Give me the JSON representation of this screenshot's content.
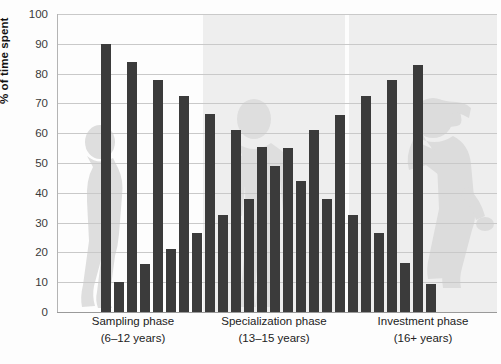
{
  "chart_data": {
    "type": "bar",
    "title": "",
    "xlabel": "",
    "ylabel": "% of time spent",
    "ylim": [
      0,
      100
    ],
    "yticks": [
      0,
      10,
      20,
      30,
      40,
      50,
      60,
      70,
      80,
      90,
      100
    ],
    "grid": true,
    "legend": "none",
    "phases": [
      {
        "name": "Sampling phase",
        "age_range": "(6–12 years)",
        "shaded": false
      },
      {
        "name": "Specialization phase",
        "age_range": "(13–15 years)",
        "shaded": true
      },
      {
        "name": "Investment phase",
        "age_range": "(16+ years)",
        "shaded": true
      }
    ],
    "categories": [
      "S1a",
      "S1b",
      "S2a",
      "S2b",
      "S3a",
      "S3b",
      "S4a",
      "S4b",
      "S5a",
      "S5b",
      "P1a",
      "P1b",
      "P2a",
      "P2b",
      "P3a",
      "P3b",
      "P4a",
      "P4b",
      "P5a",
      "P5b",
      "I1a",
      "I1b",
      "I2a",
      "I2b",
      "I3a",
      "I3b",
      "I4a",
      "I4b",
      "I5a",
      "I5b"
    ],
    "values": [
      90,
      10,
      84,
      16,
      78,
      21,
      72.5,
      26.5,
      66.5,
      32.5,
      61,
      38,
      55.5,
      49,
      55,
      44,
      61,
      38,
      66,
      32.5,
      72.5,
      26.5,
      78,
      16.5,
      83,
      9.5,
      89,
      0,
      0,
      0
    ],
    "bars": [
      {
        "value": 90,
        "phase": "Sampling phase"
      },
      {
        "value": 10,
        "phase": "Sampling phase"
      },
      {
        "value": 84,
        "phase": "Sampling phase"
      },
      {
        "value": 16,
        "phase": "Sampling phase"
      },
      {
        "value": 78,
        "phase": "Sampling phase"
      },
      {
        "value": 21,
        "phase": "Sampling phase"
      },
      {
        "value": 72.5,
        "phase": "Sampling phase"
      },
      {
        "value": 26.5,
        "phase": "Sampling phase"
      },
      {
        "value": 66.5,
        "phase": "Sampling phase"
      },
      {
        "value": 32.5,
        "phase": "Sampling phase"
      },
      {
        "value": 61,
        "phase": "Specialization phase"
      },
      {
        "value": 38,
        "phase": "Specialization phase"
      },
      {
        "value": 55.5,
        "phase": "Specialization phase"
      },
      {
        "value": 49,
        "phase": "Specialization phase"
      },
      {
        "value": 55,
        "phase": "Specialization phase"
      },
      {
        "value": 44,
        "phase": "Specialization phase"
      },
      {
        "value": 61,
        "phase": "Specialization phase"
      },
      {
        "value": 38,
        "phase": "Specialization phase"
      },
      {
        "value": 66,
        "phase": "Specialization phase"
      },
      {
        "value": 32.5,
        "phase": "Specialization phase"
      },
      {
        "value": 72.5,
        "phase": "Investment phase"
      },
      {
        "value": 26.5,
        "phase": "Investment phase"
      },
      {
        "value": 78,
        "phase": "Investment phase"
      },
      {
        "value": 16.5,
        "phase": "Investment phase"
      },
      {
        "value": 83,
        "phase": "Investment phase"
      },
      {
        "value": 9.5,
        "phase": "Investment phase"
      }
    ],
    "colors": {
      "bar": "#3b3b3b",
      "grid": "#c9c9c9",
      "band": "#eeeeee",
      "silhouette": "#dcdcdc",
      "text": "#222222",
      "background": "#fdfdfd"
    },
    "silhouettes": [
      {
        "name": "child-silhouette",
        "phase": "Sampling phase"
      },
      {
        "name": "teen-silhouette",
        "phase": "Specialization phase"
      },
      {
        "name": "golfer-silhouette",
        "phase": "Investment phase"
      }
    ]
  }
}
